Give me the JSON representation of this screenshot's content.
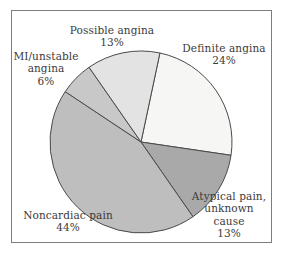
{
  "figure": {
    "background_color": "#ffffff",
    "frame_color": "#7d7d7d",
    "text_color": "#3b3b3b",
    "slice_outline_color": "#4a4a4a"
  },
  "chart_data": {
    "type": "pie",
    "title": "",
    "xlabel": "",
    "ylabel": "",
    "legend_position": "none",
    "grid": false,
    "start_angle_deg": 12,
    "direction": "clockwise",
    "center": {
      "x": 141,
      "y": 142
    },
    "radius": 91,
    "total_percent": 100,
    "categories": [
      "Definite angina",
      "Atypical pain, unknown cause",
      "Noncardiac pain",
      "MI/unstable angina",
      "Possible angina"
    ],
    "values": [
      24,
      13,
      44,
      6,
      13
    ],
    "colors": [
      "#f6f6f4",
      "#a9a9a9",
      "#bebebe",
      "#c8c8c8",
      "#e3e3e3"
    ],
    "slices": [
      {
        "name": "Definite angina",
        "value": 24,
        "percent_label": "24%",
        "color": "#f6f6f4",
        "start_deg": 12,
        "end_deg": 98.4
      },
      {
        "name": "Atypical pain, unknown cause",
        "value": 13,
        "percent_label": "13%",
        "color": "#a9a9a9",
        "start_deg": 98.4,
        "end_deg": 145.2
      },
      {
        "name": "Noncardiac pain",
        "value": 44,
        "percent_label": "44%",
        "color": "#bebebe",
        "start_deg": 145.2,
        "end_deg": 303.6
      },
      {
        "name": "MI/unstable angina",
        "value": 6,
        "percent_label": "6%",
        "color": "#c8c8c8",
        "start_deg": 303.6,
        "end_deg": 325.2
      },
      {
        "name": "Possible angina",
        "value": 13,
        "percent_label": "13%",
        "color": "#e3e3e3",
        "start_deg": 325.2,
        "end_deg": 372
      }
    ]
  },
  "labels": {
    "possible_angina": {
      "line1": "Possible angina",
      "line2": "13%"
    },
    "definite_angina": {
      "line1": "Definite angina",
      "line2": "24%"
    },
    "mi_unstable_angina": {
      "line1": "MI/unstable",
      "line2": "angina",
      "line3": "6%"
    },
    "noncardiac_pain": {
      "line1": "Noncardiac pain",
      "line2": "44%"
    },
    "atypical_pain": {
      "line1": "Atypical pain,",
      "line2": "unknown",
      "line3": "cause",
      "line4": "13%"
    }
  }
}
